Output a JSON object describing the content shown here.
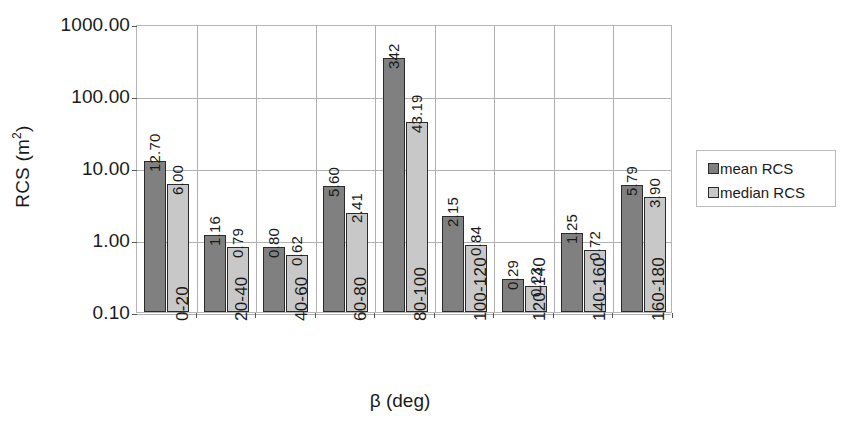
{
  "chart_data": {
    "type": "bar",
    "title": "",
    "xlabel": "β (deg)",
    "ylabel": "RCS (m²)",
    "ylabel_base": "RCS (m",
    "ylabel_sup": "2",
    "ylabel_close": ")",
    "yscale": "log",
    "ylim": [
      0.1,
      1000.0
    ],
    "ytick_labels": [
      "1000.00",
      "100.00",
      "10.00",
      "1.00",
      "0.10"
    ],
    "ytick_values": [
      1000,
      100,
      10,
      1,
      0.1
    ],
    "grid": true,
    "legend_position": "right",
    "categories": [
      "0-20",
      "20-40",
      "40-60",
      "60-80",
      "80-100",
      "100-120",
      "120-140",
      "140-160",
      "160-180"
    ],
    "series": [
      {
        "name": "mean RCS",
        "color": "#808080",
        "values": [
          12.7,
          1.16,
          0.8,
          5.6,
          342,
          2.15,
          0.29,
          1.25,
          5.79
        ],
        "labels": [
          "12.70",
          "1.16",
          "0.80",
          "5.60",
          "342",
          "2.15",
          "0.29",
          "1.25",
          "5.79"
        ]
      },
      {
        "name": "median RCS",
        "color": "#c8c8c8",
        "values": [
          6.0,
          0.79,
          0.62,
          2.41,
          43.19,
          0.84,
          0.23,
          0.72,
          3.9
        ],
        "labels": [
          "6.00",
          "0.79",
          "0.62",
          "2.41",
          "43.19",
          "0.84",
          "0.23",
          "0.72",
          "3.90"
        ]
      }
    ]
  },
  "legend": {
    "items": [
      {
        "label": "mean RCS",
        "swatch": "mean"
      },
      {
        "label": "median RCS",
        "swatch": "median"
      }
    ]
  }
}
